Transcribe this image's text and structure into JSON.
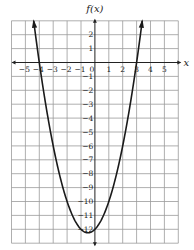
{
  "chart_data": {
    "type": "line",
    "title": "",
    "xlabel": "x",
    "ylabel": "f(x)",
    "function": "f(x) = x^2 + x - 12",
    "xlim": [
      -6,
      6
    ],
    "ylim": [
      -13,
      3
    ],
    "grid": true,
    "x_ticks": [
      -5,
      -4,
      -3,
      -2,
      -1,
      0,
      1,
      2,
      3,
      4,
      5
    ],
    "x_tick_labels": [
      "−5",
      "−4",
      "−3",
      "−2",
      "−1",
      "0",
      "1",
      "2",
      "3",
      "4",
      "5"
    ],
    "y_ticks": [
      2,
      1,
      -1,
      -2,
      -3,
      -4,
      -5,
      -6,
      -7,
      -8,
      -9,
      -10,
      -11,
      -12
    ],
    "y_tick_labels": [
      "2",
      "1",
      "−1",
      "−2",
      "−3",
      "−4",
      "−5",
      "−6",
      "−7",
      "−8",
      "−9",
      "−10",
      "−11",
      "−12"
    ],
    "roots": [
      -4,
      3
    ],
    "vertex": [
      -0.5,
      -12.25
    ],
    "y_intercept": -12,
    "curve_ends": "arrows at both ends (y = 3)",
    "series": [
      {
        "name": "f(x)",
        "x": [
          -4.4,
          -4,
          -3,
          -2,
          -1,
          -0.5,
          0,
          1,
          2,
          3,
          3.4
        ],
        "y": [
          2.96,
          0,
          -6,
          -10,
          -12,
          -12.25,
          -12,
          -10,
          -6,
          0,
          2.96
        ]
      }
    ]
  },
  "colors": {
    "grid": "#9a9a9a",
    "axis": "#222222",
    "curve": "#1a1a1a",
    "background": "#ffffff"
  },
  "layout": {
    "origin_px": [
      94.9,
      62.5
    ],
    "unit_px": 13.9
  }
}
